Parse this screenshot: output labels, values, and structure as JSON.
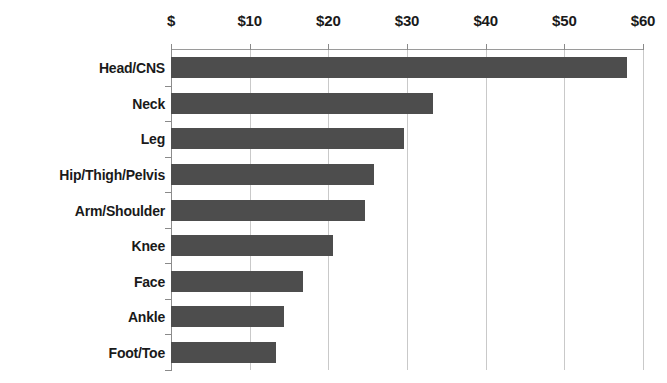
{
  "chart_data": {
    "type": "bar",
    "orientation": "horizontal",
    "title": "",
    "subtitle": "",
    "xlabel": "",
    "ylabel": "",
    "categories": [
      "Head/CNS",
      "Neck",
      "Leg",
      "Hip/Thigh/Pelvis",
      "Arm/Shoulder",
      "Knee",
      "Face",
      "Ankle",
      "Foot/Toe"
    ],
    "values": [
      58.0,
      33.3,
      29.6,
      25.8,
      24.6,
      20.6,
      16.8,
      14.4,
      13.3
    ],
    "value_prefix": "$",
    "xlim": [
      0,
      60
    ],
    "xticks": [
      0,
      10,
      20,
      30,
      40,
      50,
      60
    ],
    "xtick_labels": [
      "$",
      "$10",
      "$20",
      "$30",
      "$40",
      "$50",
      "$60"
    ],
    "grid": true,
    "grid_axis": "x",
    "legend": false,
    "legend_position": "none",
    "axis_position": "top",
    "series": [
      {
        "name": "Cost",
        "color": "#4d4d4d",
        "values": [
          58.0,
          33.3,
          29.6,
          25.8,
          24.6,
          20.6,
          16.8,
          14.4,
          13.3
        ]
      }
    ]
  },
  "colors": {
    "bar": "#4d4d4d",
    "gridline": "#c9c9c9",
    "axis": "#8a8a8a",
    "text": "#1a1a1a",
    "background": "#ffffff"
  }
}
